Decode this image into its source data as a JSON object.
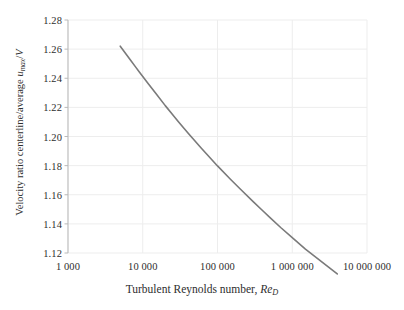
{
  "chart_data": {
    "type": "line",
    "title": "",
    "xlabel": "Turbulent Reynolds number, Re_D",
    "ylabel": "Velocity ratio centerline/average u_max/V",
    "xscale": "log",
    "yscale": "linear",
    "xlim": [
      1000,
      10000000
    ],
    "ylim": [
      1.12,
      1.28
    ],
    "grid": true,
    "legend": null,
    "xticklabels": [
      "1 000",
      "10 000",
      "100 000",
      "1 000 000",
      "10 000 000"
    ],
    "xtickvalues": [
      1000,
      10000,
      100000,
      1000000,
      10000000
    ],
    "yticklabels": [
      "1.12",
      "1.14",
      "1.16",
      "1.18",
      "1.20",
      "1.22",
      "1.24",
      "1.26",
      "1.28"
    ],
    "ytickvalues": [
      1.12,
      1.14,
      1.16,
      1.18,
      1.2,
      1.22,
      1.24,
      1.26,
      1.28
    ],
    "series": [
      {
        "name": "centerline-to-average velocity ratio",
        "color": "#7a7a7a",
        "x": [
          5000,
          6000,
          7000,
          8000,
          9000,
          10000,
          12000,
          15000,
          20000,
          25000,
          30000,
          40000,
          50000,
          60000,
          80000,
          100000,
          150000,
          200000,
          300000,
          400000,
          500000,
          700000,
          1000000,
          1500000,
          2000000,
          3000000,
          4000000
        ],
        "y": [
          1.262,
          1.2565,
          1.2518,
          1.2478,
          1.2443,
          1.2412,
          1.2359,
          1.2295,
          1.2212,
          1.2151,
          1.2102,
          1.2026,
          1.1969,
          1.1923,
          1.1852,
          1.1798,
          1.1705,
          1.1641,
          1.1553,
          1.1492,
          1.1445,
          1.1375,
          1.1306,
          1.1227,
          1.1177,
          1.1106,
          1.1056
        ]
      }
    ]
  },
  "axes": {
    "x_title_text": "Turbulent Reynolds number, ",
    "x_title_symbol": "Re",
    "x_title_subscript": "D",
    "y_title_text": "Velocity ratio centerline/average ",
    "y_title_symbol": "u",
    "y_title_subscript": "max",
    "y_title_suffix": "/",
    "y_title_symbol2": "V"
  },
  "style": {
    "curve_color": "#7a7a7a",
    "grid_color": "#ededed",
    "axis_color": "#b9b9b9",
    "text_color": "#2e2e2e",
    "background": "#ffffff"
  }
}
